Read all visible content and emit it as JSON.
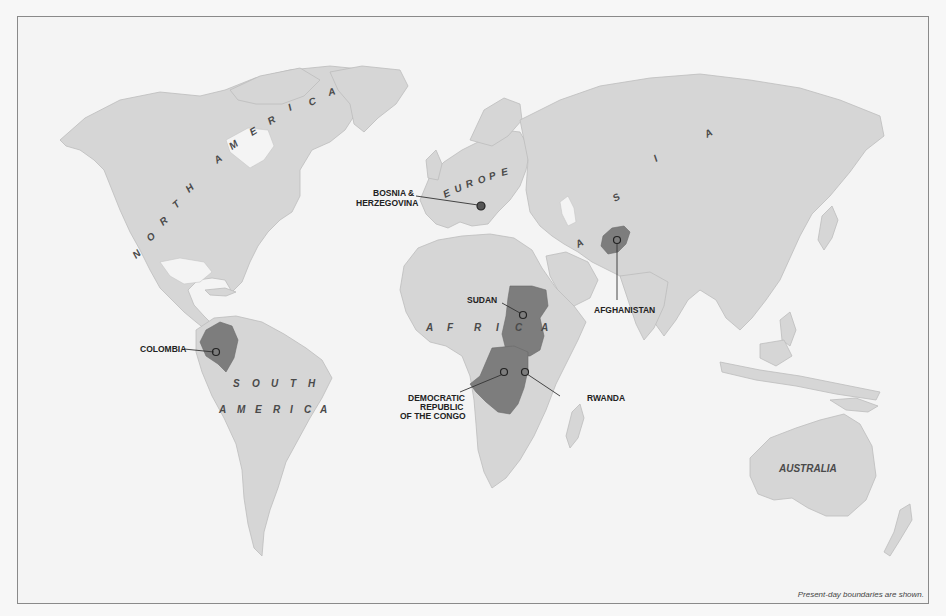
{
  "map": {
    "title": "",
    "continents": {
      "north_america": [
        "N",
        "O",
        "R",
        "T",
        "H",
        "A",
        "M",
        "E",
        "R",
        "I",
        "C",
        "A"
      ],
      "south_america_line1": [
        "S",
        "O",
        "U",
        "T",
        "H"
      ],
      "south_america_line2": [
        "A",
        "M",
        "E",
        "R",
        "I",
        "C",
        "A"
      ],
      "europe": [
        "E",
        "U",
        "R",
        "O",
        "P",
        "E"
      ],
      "africa": [
        "A",
        "F",
        "R",
        "I",
        "C",
        "A"
      ],
      "asia": [
        "A",
        "S",
        "I",
        "A"
      ],
      "australia": "AUSTRALIA"
    },
    "highlighted_countries": [
      {
        "name": "COLOMBIA",
        "label_lines": [
          "COLOMBIA"
        ]
      },
      {
        "name": "BOSNIA & HERZEGOVINA",
        "label_lines": [
          "BOSNIA &",
          "HERZEGOVINA"
        ]
      },
      {
        "name": "SUDAN",
        "label_lines": [
          "SUDAN"
        ]
      },
      {
        "name": "AFGHANISTAN",
        "label_lines": [
          "AFGHANISTAN"
        ]
      },
      {
        "name": "DEMOCRATIC REPUBLIC OF THE CONGO",
        "label_lines": [
          "DEMOCRATIC",
          "REPUBLIC",
          "OF THE CONGO"
        ]
      },
      {
        "name": "RWANDA",
        "label_lines": [
          "RWANDA"
        ]
      }
    ],
    "footnote": "Present-day boundaries are shown.",
    "colors": {
      "background": "#f4f4f4",
      "land": "#d6d6d6",
      "highlight": "#7d7d7d",
      "frame": "#8a8a8a"
    }
  }
}
